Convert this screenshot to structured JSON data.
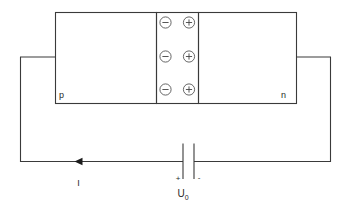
{
  "figure": {
    "regions": {
      "p_label": "p",
      "n_label": "n"
    },
    "depletion": {
      "negative_sign": "−",
      "positive_sign": "+",
      "negative_count": 3,
      "positive_count": 3,
      "rows": [
        {
          "negative": "−",
          "positive": "+"
        },
        {
          "negative": "−",
          "positive": "+"
        },
        {
          "negative": "−",
          "positive": "+"
        }
      ]
    },
    "circuit": {
      "current_label": "I",
      "battery": {
        "plus_label": "+",
        "minus_label": "-",
        "voltage_label": "U",
        "voltage_subscript": "0"
      }
    },
    "colors": {
      "background": "#ffffff",
      "line": "#3a3a3a",
      "symbol": "#555555",
      "text": "#2a2a2a",
      "arrow": "#1c1c1c"
    }
  }
}
